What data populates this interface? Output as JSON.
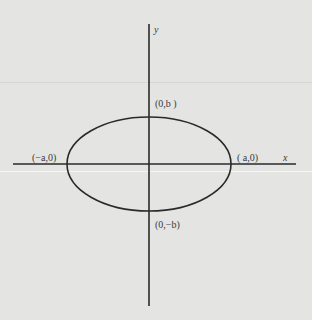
{
  "diagram": {
    "type": "ellipse-on-axes",
    "axes": {
      "x_label": "x",
      "y_label": "y",
      "origin_px": [
        149,
        164
      ],
      "x_axis_px": {
        "x1": 13,
        "x2": 296,
        "y": 164
      },
      "y_axis_px": {
        "x": 149,
        "y1": 24,
        "y2": 306
      }
    },
    "ellipse": {
      "center_px": [
        149,
        164
      ],
      "rx_px": 82,
      "ry_px": 47,
      "stroke": "#2a2a2a"
    },
    "vertices": [
      {
        "id": "left",
        "label": "(−a,0)",
        "pos_px": [
          32,
          153
        ]
      },
      {
        "id": "right",
        "label": "( a,0)",
        "pos_px": [
          237,
          153
        ]
      },
      {
        "id": "top",
        "label": "(0,b )",
        "pos_px": [
          155,
          98
        ]
      },
      {
        "id": "bottom",
        "label": "(0,−b)",
        "pos_px": [
          155,
          219
        ]
      }
    ],
    "colors": {
      "background": "#e4e4e2",
      "ink": "#2a2a2a",
      "label": "#3a3a3a"
    }
  }
}
